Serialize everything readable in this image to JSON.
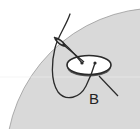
{
  "illustration": {
    "subject": "sewing a button onto fabric with needle and thread",
    "label_b": "B",
    "colors": {
      "background": "#ffffff",
      "fabric": "#d9d9d9",
      "fabric_edge": "#9a9a9a",
      "button_fill": "#ffffff",
      "button_edge": "#2a2a2a",
      "thread": "#2a2a2a"
    }
  }
}
